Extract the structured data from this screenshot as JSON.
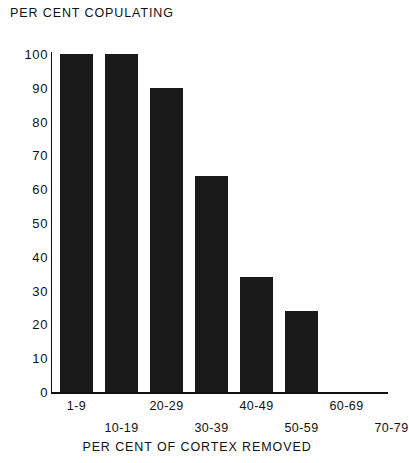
{
  "chart_data": {
    "type": "bar",
    "title": "",
    "ylabel": "PER CENT COPULATING",
    "xlabel": "PER CENT OF CORTEX REMOVED",
    "categories": [
      "1-9",
      "10-19",
      "20-29",
      "30-39",
      "40-49",
      "50-59",
      "60-69",
      "70-79"
    ],
    "values": [
      100,
      100,
      90,
      64,
      34,
      24,
      0,
      0
    ],
    "ylim": [
      0,
      100
    ],
    "yticks": [
      0,
      10,
      20,
      30,
      40,
      50,
      60,
      70,
      80,
      90,
      100
    ],
    "ytick_labels": [
      "0",
      "10",
      "20",
      "30",
      "40",
      "50",
      "60",
      "70",
      "80",
      "90",
      "100"
    ],
    "grid": false,
    "legend": "none",
    "bar_color": "#1a1a1a",
    "axis_color": "#111111",
    "background_color": "#ffffff",
    "xtick_stagger": [
      "top",
      "bottom",
      "top",
      "bottom",
      "top",
      "bottom",
      "top",
      "bottom"
    ]
  },
  "axes": {
    "y_title_line1": "PER CENT",
    "y_title_line2": "COPULATING",
    "x_title": "PER CENT OF CORTEX REMOVED"
  }
}
